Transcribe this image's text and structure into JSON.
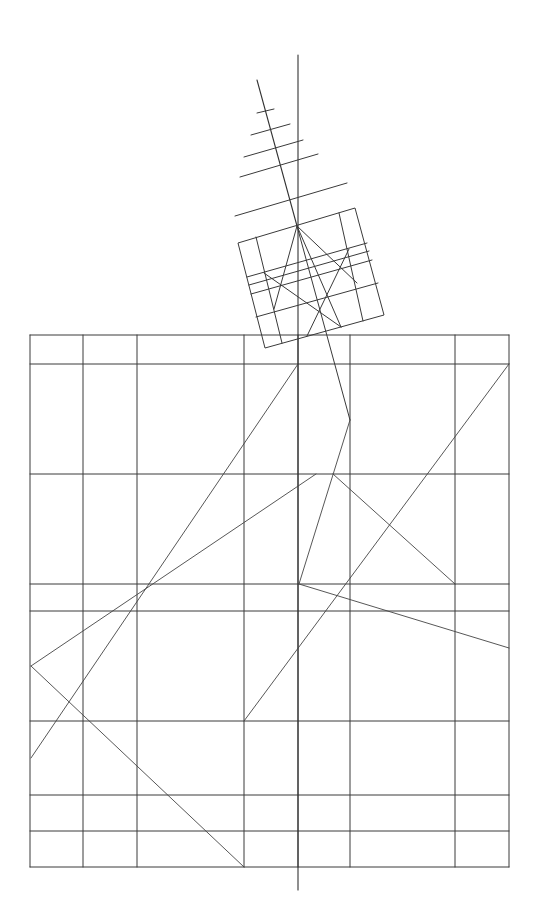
{
  "colors": {
    "background": "#ffffff",
    "stroke": "#3a3a3a",
    "fine_stroke": "#555555"
  },
  "grid": {
    "left": 30,
    "right": 509,
    "top": 335,
    "bottom": 867,
    "verticals": [
      30,
      83,
      137,
      244,
      298,
      350,
      455,
      509
    ],
    "horizontals": [
      335,
      364,
      474,
      584,
      611,
      721,
      795,
      831,
      867
    ]
  },
  "axis_line": {
    "x1": 298,
    "y1": 55,
    "x2": 298,
    "y2": 890
  },
  "diagonal_spine": {
    "x1": 257,
    "y1": 80,
    "x2": 297,
    "y2": 226
  },
  "crossbars": [
    {
      "x1": 257,
      "y1": 113,
      "x2": 274,
      "y2": 109
    },
    {
      "x1": 251,
      "y1": 135,
      "x2": 290,
      "y2": 124
    },
    {
      "x1": 244,
      "y1": 157,
      "x2": 303,
      "y2": 140
    },
    {
      "x1": 240,
      "y1": 177,
      "x2": 318,
      "y2": 154
    },
    {
      "x1": 235,
      "y1": 216,
      "x2": 347,
      "y2": 183
    }
  ],
  "rotated_square": {
    "corners": [
      [
        238,
        243
      ],
      [
        355,
        208
      ],
      [
        384,
        315
      ],
      [
        265,
        348
      ]
    ],
    "inner_lines": [
      {
        "x1": 256,
        "y1": 237,
        "x2": 282,
        "y2": 343
      },
      {
        "x1": 339,
        "y1": 213,
        "x2": 363,
        "y2": 321
      },
      {
        "x1": 247,
        "y1": 277,
        "x2": 367,
        "y2": 243
      },
      {
        "x1": 249,
        "y1": 285,
        "x2": 369,
        "y2": 251
      },
      {
        "x1": 251,
        "y1": 294,
        "x2": 372,
        "y2": 260
      },
      {
        "x1": 256,
        "y1": 317,
        "x2": 378,
        "y2": 283
      },
      {
        "x1": 297,
        "y1": 226,
        "x2": 274,
        "y2": 309
      },
      {
        "x1": 297,
        "y1": 226,
        "x2": 341,
        "y2": 327
      },
      {
        "x1": 297,
        "y1": 226,
        "x2": 357,
        "y2": 283
      },
      {
        "x1": 297,
        "y1": 226,
        "x2": 350,
        "y2": 420
      },
      {
        "x1": 264,
        "y1": 273,
        "x2": 341,
        "y2": 327
      },
      {
        "x1": 349,
        "y1": 249,
        "x2": 307,
        "y2": 336
      }
    ]
  },
  "composition_lines": [
    {
      "x1": 298,
      "y1": 364,
      "x2": 31,
      "y2": 758
    },
    {
      "x1": 31,
      "y1": 666,
      "x2": 316,
      "y2": 474
    },
    {
      "x1": 31,
      "y1": 666,
      "x2": 244,
      "y2": 867
    },
    {
      "x1": 350,
      "y1": 420,
      "x2": 299,
      "y2": 584
    },
    {
      "x1": 333,
      "y1": 474,
      "x2": 455,
      "y2": 584
    },
    {
      "x1": 299,
      "y1": 584,
      "x2": 509,
      "y2": 648
    },
    {
      "x1": 509,
      "y1": 364,
      "x2": 244,
      "y2": 721
    }
  ]
}
